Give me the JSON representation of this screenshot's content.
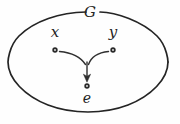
{
  "figure": {
    "kind": "group-binary-operation-diagram",
    "set_label": "G",
    "background_color": "#fefefe",
    "stroke_color": "#242424",
    "node_color": "#2a2a2a",
    "boundary": {
      "shape": "ellipse",
      "center_x": 88,
      "center_y": 62,
      "radius_x": 80,
      "radius_y": 50,
      "stroke_width": 1.6,
      "label_gap_degrees": 16
    },
    "nodes": [
      {
        "id": "x",
        "label": "x",
        "x": 55,
        "y": 50,
        "label_x": 55,
        "label_y": 33,
        "label_position": "above",
        "dot_radius": 2.6
      },
      {
        "id": "y",
        "label": "y",
        "x": 113,
        "y": 50,
        "label_x": 113,
        "label_y": 33,
        "label_position": "above",
        "dot_radius": 2.6
      },
      {
        "id": "e",
        "label": "e",
        "x": 87,
        "y": 86,
        "label_x": 87,
        "label_y": 100,
        "label_position": "below",
        "dot_radius": 2.6
      }
    ],
    "arrows": [
      {
        "id": "x-to-e",
        "from": "x",
        "to": "e",
        "style": "curved",
        "arrowhead": false
      },
      {
        "id": "y-to-e",
        "from": "y",
        "to": "e",
        "style": "curved",
        "arrowhead": false
      },
      {
        "id": "merge-to-e",
        "from": "merge-point",
        "to": "e",
        "style": "straight",
        "arrowhead": true
      }
    ],
    "caption_sliver": "partially cropped caption"
  }
}
